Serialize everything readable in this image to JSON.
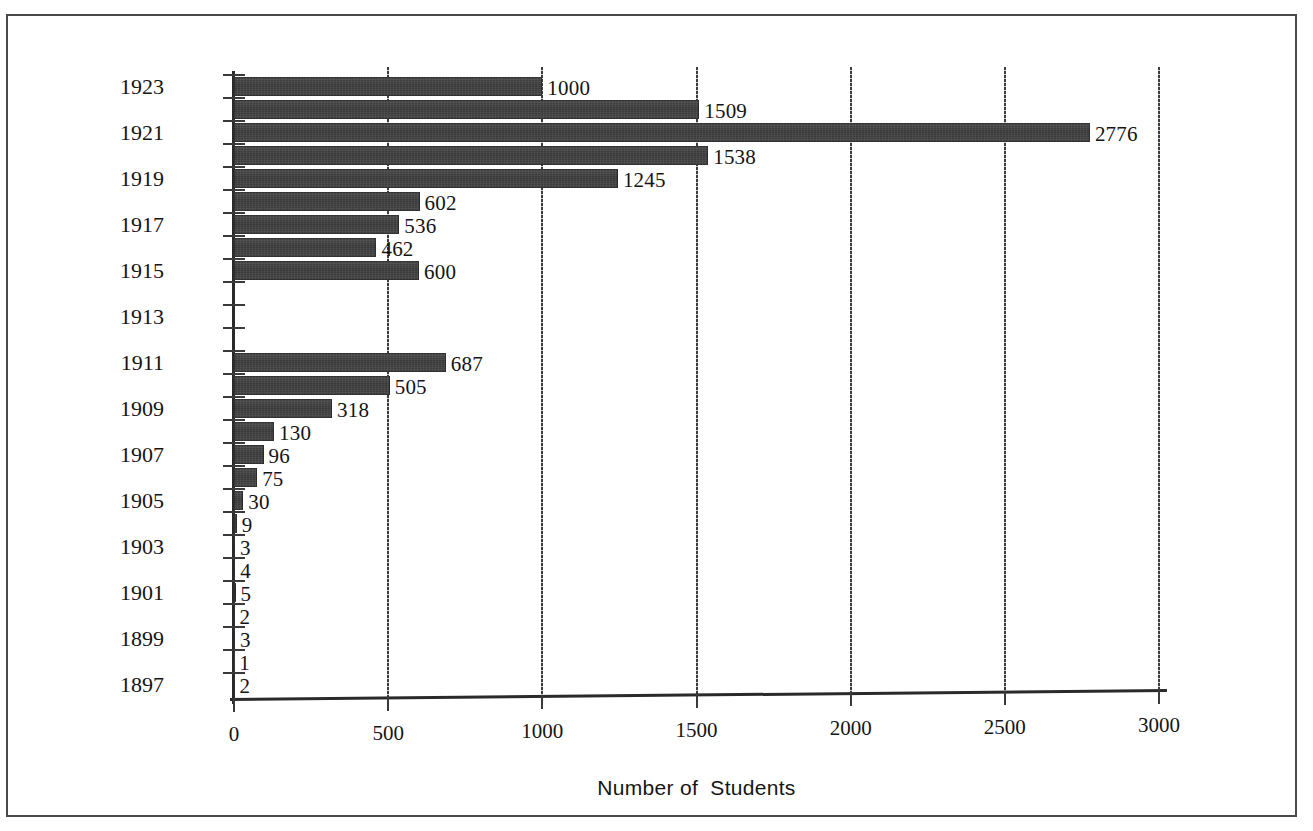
{
  "chart_data": {
    "type": "bar",
    "orientation": "horizontal",
    "title": "",
    "xlabel": "Number of  Students",
    "ylabel": "",
    "xlim": [
      0,
      3000
    ],
    "xticks": [
      0,
      500,
      1000,
      1500,
      2000,
      2500,
      3000
    ],
    "xtick_labels": [
      "0",
      "500",
      "1000",
      "1500",
      "2000",
      "2500",
      "3000"
    ],
    "grid": true,
    "legend": false,
    "bar_color": "#3b3b3b",
    "categories": [
      "1897",
      "1898",
      "1899",
      "1900",
      "1901",
      "1902",
      "1903",
      "1904",
      "1905",
      "1906",
      "1907",
      "1908",
      "1909",
      "1910",
      "1911",
      "1912",
      "1913",
      "1914",
      "1915",
      "1916",
      "1917",
      "1918",
      "1919",
      "1920",
      "1921",
      "1922",
      "1923"
    ],
    "values": [
      2,
      1,
      3,
      2,
      5,
      4,
      3,
      9,
      30,
      75,
      96,
      130,
      318,
      505,
      687,
      0,
      0,
      0,
      600,
      462,
      536,
      602,
      1245,
      1538,
      2776,
      1509,
      1000
    ],
    "data_labels": [
      "2",
      "1",
      "3",
      "2",
      "5",
      "4",
      "3",
      "9",
      "30",
      "75",
      "96",
      "130",
      "318",
      "505",
      "687",
      "",
      "",
      "",
      "600",
      "462",
      "536",
      "602",
      "1245",
      "1538",
      "2776",
      "1509",
      "1000"
    ],
    "ytick_labels": [
      "1897",
      "1899",
      "1901",
      "1903",
      "1905",
      "1907",
      "1909",
      "1911",
      "1913",
      "1915",
      "1917",
      "1919",
      "1921",
      "1923"
    ],
    "ytick_label_categories": [
      "1897",
      "1899",
      "1901",
      "1903",
      "1905",
      "1907",
      "1909",
      "1911",
      "1913",
      "1915",
      "1917",
      "1919",
      "1921",
      "1923"
    ]
  }
}
